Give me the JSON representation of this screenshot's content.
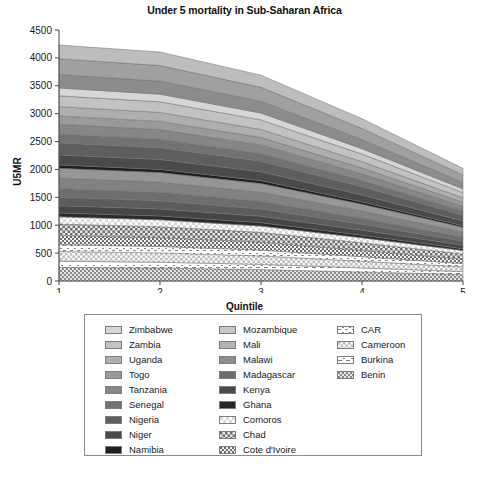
{
  "chart_data": {
    "type": "area",
    "stacked": true,
    "title": "Under 5 mortality in Sub-Saharan Africa",
    "xlabel": "Quintile",
    "ylabel": "U5MR",
    "x": [
      1,
      2,
      3,
      4,
      5
    ],
    "xticklabels": [
      "1",
      "2",
      "3",
      "4",
      "5"
    ],
    "xlim": [
      1,
      5
    ],
    "ylim": [
      0,
      4500
    ],
    "yticks": [
      0,
      500,
      1000,
      1500,
      2000,
      2500,
      3000,
      3500,
      4000,
      4500
    ],
    "yticklabels": [
      "0",
      "500",
      "1000",
      "1500",
      "2000",
      "2500",
      "3000",
      "3500",
      "4000",
      "4500"
    ],
    "grid": false,
    "legend_position": "below-plot",
    "legend_columns": 3,
    "totals": [
      4230,
      4180,
      3750,
      2960,
      2070
    ],
    "series": [
      {
        "name": "Benin",
        "values": [
          245,
          232,
          205,
          162,
          118
        ],
        "fill": "pattern-benin",
        "legend_col": 2
      },
      {
        "name": "Burkina",
        "values": [
          110,
          104,
          93,
          72,
          50
        ],
        "fill": "pattern-burkina",
        "legend_col": 2
      },
      {
        "name": "Cameroon",
        "values": [
          175,
          168,
          152,
          120,
          86
        ],
        "fill": "pattern-cameroon",
        "legend_col": 2
      },
      {
        "name": "CAR",
        "values": [
          120,
          115,
          104,
          82,
          58
        ],
        "fill": "pattern-car",
        "legend_col": 2
      },
      {
        "name": "Cote d'Ivoire",
        "values": [
          165,
          158,
          142,
          112,
          78
        ],
        "fill": "pattern-cote",
        "legend_col": 1
      },
      {
        "name": "Chad",
        "values": [
          205,
          196,
          176,
          138,
          96
        ],
        "fill": "pattern-chad",
        "legend_col": 1
      },
      {
        "name": "Comoros",
        "values": [
          130,
          124,
          112,
          88,
          60
        ],
        "fill": "pattern-comoros",
        "legend_col": 1
      },
      {
        "name": "Ghana",
        "values": [
          70,
          68,
          61,
          48,
          34
        ],
        "fill": "#2a2a2a",
        "legend_col": 1
      },
      {
        "name": "Kenya",
        "values": [
          130,
          126,
          114,
          90,
          62
        ],
        "fill": "#464646",
        "legend_col": 1
      },
      {
        "name": "Madagascar",
        "values": [
          150,
          146,
          132,
          104,
          72
        ],
        "fill": "#5c5c5c",
        "legend_col": 1
      },
      {
        "name": "Malawi",
        "values": [
          160,
          156,
          141,
          111,
          77
        ],
        "fill": "#6e6e6e",
        "legend_col": 1
      },
      {
        "name": "Mali",
        "values": [
          185,
          180,
          162,
          128,
          88
        ],
        "fill": "#828282",
        "legend_col": 1
      },
      {
        "name": "Mozambique",
        "values": [
          175,
          170,
          153,
          121,
          84
        ],
        "fill": "#969696",
        "legend_col": 1
      },
      {
        "name": "Namibia",
        "values": [
          60,
          58,
          52,
          41,
          28
        ],
        "fill": "#1f1f1f",
        "legend_col": 0
      },
      {
        "name": "Niger",
        "values": [
          180,
          176,
          158,
          125,
          86
        ],
        "fill": "#4a4a4a",
        "legend_col": 0
      },
      {
        "name": "Nigeria",
        "values": [
          215,
          210,
          189,
          149,
          103
        ],
        "fill": "#5e5e5e",
        "legend_col": 0
      },
      {
        "name": "Senegal",
        "values": [
          160,
          156,
          140,
          110,
          76
        ],
        "fill": "#727272",
        "legend_col": 0
      },
      {
        "name": "Tanzania",
        "values": [
          175,
          171,
          154,
          121,
          84
        ],
        "fill": "#868686",
        "legend_col": 0
      },
      {
        "name": "Togo",
        "values": [
          150,
          147,
          132,
          104,
          72
        ],
        "fill": "#9a9a9a",
        "legend_col": 0
      },
      {
        "name": "Uganda",
        "values": [
          165,
          161,
          145,
          114,
          79
        ],
        "fill": "#aeaeae",
        "legend_col": 0
      },
      {
        "name": "Zambia",
        "values": [
          195,
          190,
          171,
          135,
          93
        ],
        "fill": "#c2c2c2",
        "legend_col": 0
      },
      {
        "name": "Zimbabwe",
        "values": [
          140,
          137,
          123,
          97,
          67
        ],
        "fill": "#d6d6d6",
        "legend_col": 0
      },
      {
        "name": "band-upper-1",
        "values": [
          240,
          235,
          211,
          166,
          115
        ],
        "fill": "#8c8c8c",
        "legend_col": -1
      },
      {
        "name": "band-upper-2",
        "values": [
          285,
          278,
          250,
          197,
          136
        ],
        "fill": "#a0a0a0",
        "legend_col": -1
      },
      {
        "name": "band-upper-3",
        "values": [
          245,
          243,
          218,
          175,
          118
        ],
        "fill": "#bdbdbd",
        "legend_col": -1
      }
    ]
  },
  "legend": {
    "columns": [
      {
        "items": [
          {
            "label": "Zimbabwe",
            "swatch": "#d6d6d6"
          },
          {
            "label": "Zambia",
            "swatch": "#c2c2c2"
          },
          {
            "label": "Uganda",
            "swatch": "#aeaeae"
          },
          {
            "label": "Togo",
            "swatch": "#9a9a9a"
          },
          {
            "label": "Tanzania",
            "swatch": "#868686"
          },
          {
            "label": "Senegal",
            "swatch": "#727272"
          },
          {
            "label": "Nigeria",
            "swatch": "#5e5e5e"
          },
          {
            "label": "Niger",
            "swatch": "#4a4a4a"
          },
          {
            "label": "Namibia",
            "swatch": "#1f1f1f"
          }
        ]
      },
      {
        "items": [
          {
            "label": "Mozambique",
            "swatch": "#c9c9c9"
          },
          {
            "label": "Mali",
            "swatch": "#b4b4b4"
          },
          {
            "label": "Malawi",
            "swatch": "#8e8e8e"
          },
          {
            "label": "Madagascar",
            "swatch": "#6b6b6b"
          },
          {
            "label": "Kenya",
            "swatch": "#4b4b4b"
          },
          {
            "label": "Ghana",
            "swatch": "#262626"
          },
          {
            "label": "Comoros",
            "swatch": "pattern-comoros"
          },
          {
            "label": "Chad",
            "swatch": "pattern-chad"
          },
          {
            "label": "Cote d'Ivoire",
            "swatch": "pattern-cote"
          }
        ]
      },
      {
        "items": [
          {
            "label": "CAR",
            "swatch": "pattern-car"
          },
          {
            "label": "Cameroon",
            "swatch": "pattern-cameroon"
          },
          {
            "label": "Burkina",
            "swatch": "pattern-burkina"
          },
          {
            "label": "Benin",
            "swatch": "pattern-benin"
          }
        ]
      }
    ]
  },
  "caption": {
    "text": ""
  },
  "colors": {
    "axis": "#555555",
    "text": "#1a1a1a",
    "legend_border": "#8a8a8a",
    "band_outline": "#6f6f6f"
  }
}
